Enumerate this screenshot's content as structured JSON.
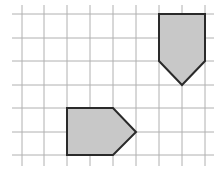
{
  "figure": {
    "edge_fragment": ":",
    "grid": {
      "columns_x": [
        22,
        44,
        67,
        90,
        113,
        136,
        159,
        182,
        205
      ],
      "rows_y": [
        14,
        38,
        61,
        85,
        108,
        132,
        155
      ],
      "h_line_extent": [
        12,
        214
      ],
      "v_line_extent": [
        5,
        166
      ],
      "line_color": "#b0b0b0"
    },
    "shapes": [
      {
        "name": "pentagon-pointing-down",
        "points": [
          [
            159,
            14
          ],
          [
            205,
            14
          ],
          [
            205,
            61
          ],
          [
            182,
            85
          ],
          [
            159,
            61
          ]
        ],
        "fill": "#c8c8c8",
        "stroke": "#2a2a2a"
      },
      {
        "name": "pentagon-pointing-right",
        "points": [
          [
            67,
            108
          ],
          [
            113,
            108
          ],
          [
            136,
            132
          ],
          [
            113,
            155
          ],
          [
            67,
            155
          ]
        ],
        "fill": "#c8c8c8",
        "stroke": "#2a2a2a"
      }
    ]
  }
}
